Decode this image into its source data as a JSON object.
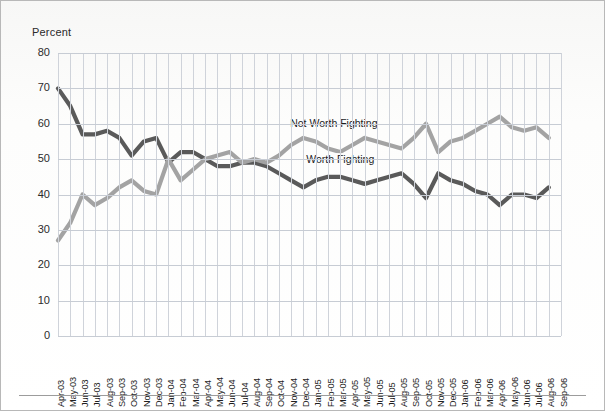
{
  "axis": {
    "y_title": "Percent",
    "y_ticks": [
      80,
      70,
      60,
      50,
      40,
      30,
      20,
      10,
      0
    ],
    "y_min": 0,
    "y_max": 80,
    "x_ticks": [
      "Apr-03",
      "May-03",
      "Jun-03",
      "Jul-03",
      "Aug-03",
      "Sep-03",
      "Oct-03",
      "Nov-03",
      "Dec-03",
      "Jan-04",
      "Feb-04",
      "Mar-04",
      "Apr-04",
      "May-04",
      "Jun-04",
      "Jul-04",
      "Aug-04",
      "Sep-04",
      "Oct-04",
      "Nov-04",
      "Dec-04",
      "Jan-05",
      "Feb-05",
      "Mar-05",
      "Apr-05",
      "May-05",
      "Jun-05",
      "Jul-05",
      "Aug-05",
      "Sep-05",
      "Oct-05",
      "Nov-05",
      "Dec-05",
      "Jan-06",
      "Feb-06",
      "Mar-06",
      "Apr-06",
      "May-06",
      "Jun-06",
      "Jul-06",
      "Aug-06",
      "Sep-06"
    ]
  },
  "labels": {
    "not_worth_fighting": "Not Worth Fighting",
    "worth_fighting": "Worth Fighting"
  },
  "colors": {
    "worth_fighting": "#5a5a5a",
    "not_worth_fighting": "#a3a3a3",
    "grid": "#cfd3da",
    "text": "#1f1f1f"
  },
  "chart_data": {
    "type": "line",
    "title": "",
    "subtitle": "",
    "xlabel": "",
    "ylabel": "Percent",
    "ylim": [
      0,
      80
    ],
    "grid": true,
    "legend": "inline-annotation",
    "x": [
      "Apr-03",
      "May-03",
      "Jun-03",
      "Jul-03",
      "Aug-03",
      "Sep-03",
      "Oct-03",
      "Nov-03",
      "Dec-03",
      "Jan-04",
      "Feb-04",
      "Mar-04",
      "Apr-04",
      "May-04",
      "Jun-04",
      "Jul-04",
      "Aug-04",
      "Sep-04",
      "Oct-04",
      "Nov-04",
      "Dec-04",
      "Jan-05",
      "Feb-05",
      "Mar-05",
      "Apr-05",
      "May-05",
      "Jun-05",
      "Jul-05",
      "Aug-05",
      "Sep-05",
      "Oct-05",
      "Nov-05",
      "Dec-05",
      "Jan-06",
      "Feb-06",
      "Mar-06",
      "Apr-06",
      "May-06",
      "Jun-06",
      "Jul-06",
      "Aug-06"
    ],
    "series": [
      {
        "name": "Worth Fighting",
        "color": "#5a5a5a",
        "values": [
          70,
          65,
          57,
          57,
          58,
          56,
          51,
          55,
          56,
          49,
          52,
          52,
          50,
          48,
          48,
          49,
          49,
          48,
          46,
          44,
          42,
          44,
          45,
          45,
          44,
          43,
          44,
          45,
          46,
          43,
          39,
          46,
          44,
          43,
          41,
          40,
          37,
          40,
          40,
          39,
          42
        ]
      },
      {
        "name": "Not Worth Fighting",
        "color": "#a3a3a3",
        "values": [
          27,
          32,
          40,
          37,
          39,
          42,
          44,
          41,
          40,
          50,
          44,
          47,
          50,
          51,
          52,
          49,
          50,
          49,
          51,
          54,
          56,
          55,
          53,
          52,
          54,
          56,
          55,
          54,
          53,
          56,
          60,
          52,
          55,
          56,
          58,
          60,
          62,
          59,
          58,
          59,
          56
        ]
      }
    ]
  }
}
